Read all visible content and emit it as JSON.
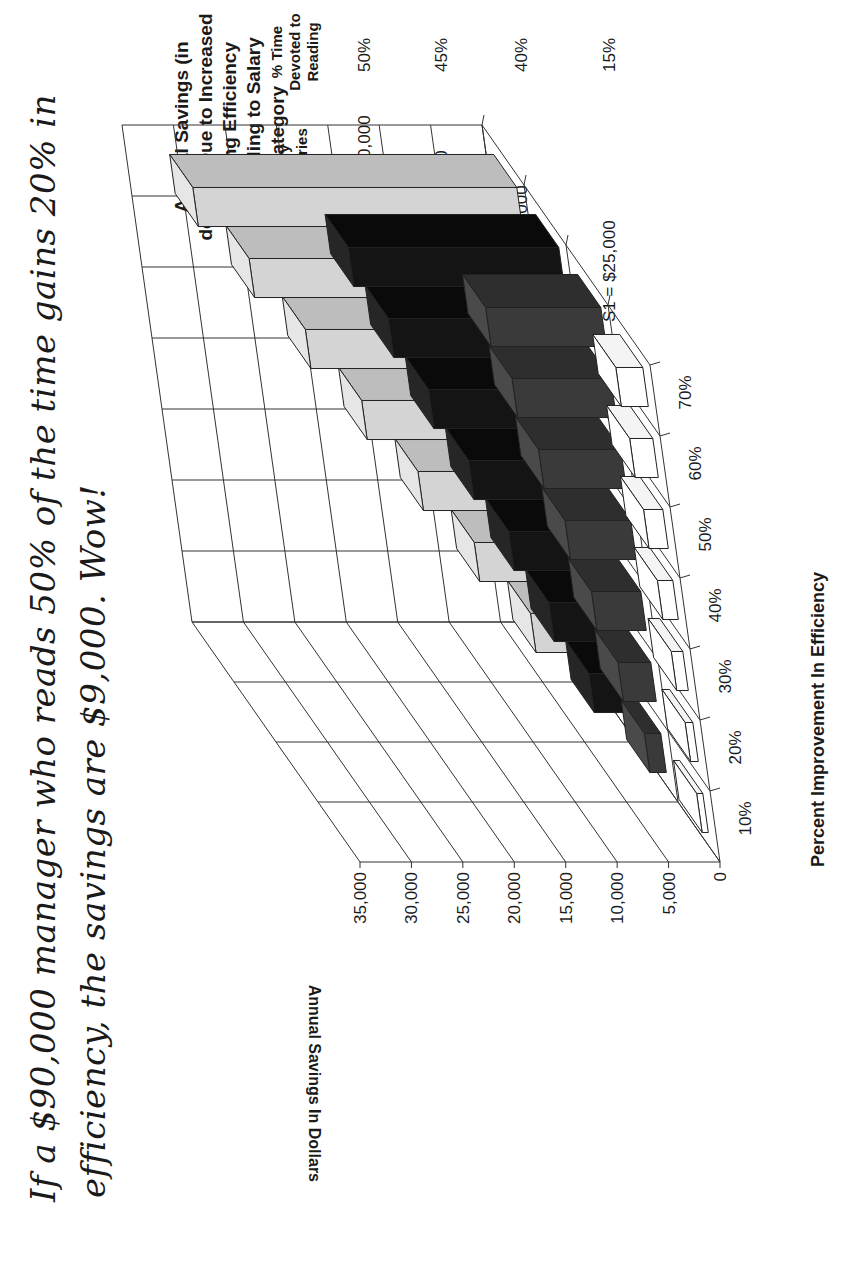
{
  "caption": {
    "line1": "If a  $90,000 manager who reads 50% of the time gains 20% in",
    "line2": "efficiency, the savings are $9,000. Wow!"
  },
  "legend": {
    "salary_header": "Salary Categories",
    "time_header": "% Time Devoted to Reading",
    "rows": [
      {
        "label": "S4 =  $90,000",
        "time": "50%"
      },
      {
        "label": "S3 =  $65,000",
        "time": "45%"
      },
      {
        "label": "S2 = $40,000",
        "time": "40%"
      },
      {
        "label": "S1 =  $25,000",
        "time": "15%"
      }
    ]
  },
  "colors": {
    "S4": "#d4d4d4",
    "S3": "#141414",
    "S2": "#3a3a3a",
    "S1": "#ffffff",
    "grid": "#333333"
  },
  "chart_data": {
    "type": "bar",
    "subtype": "3d-grouped-bar",
    "title": "Annual Savings (in dollars) Due to Increased Reading Efficiency According to Salary Category",
    "xlabel": "Percent Improvement In Efficiency",
    "ylabel": "Annual Savings In Dollars",
    "categories": [
      "10%",
      "20%",
      "30%",
      "40%",
      "50%",
      "60%",
      "70%"
    ],
    "y_ticks": [
      "0",
      "5,000",
      "10,000",
      "15,000",
      "20,000",
      "25,000",
      "30,000",
      "35,000"
    ],
    "ylim": [
      0,
      35000
    ],
    "grid": true,
    "legend_position": "right",
    "series": [
      {
        "name": "S1 = $25,000 (15% time)",
        "values": [
          375,
          750,
          1125,
          1500,
          1875,
          2250,
          2625
        ]
      },
      {
        "name": "S2 = $40,000 (40% time)",
        "values": [
          1600,
          3200,
          4800,
          6400,
          8000,
          9600,
          11200
        ]
      },
      {
        "name": "S3 = $65,000 (45% time)",
        "values": [
          2925,
          5850,
          8775,
          11700,
          14625,
          17550,
          20475
        ]
      },
      {
        "name": "S4 = $90,000 (50% time)",
        "values": [
          4500,
          9000,
          13500,
          18000,
          22500,
          27000,
          31500
        ]
      }
    ]
  }
}
